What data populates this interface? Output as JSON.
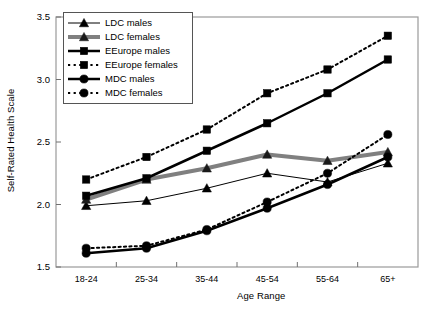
{
  "chart_data": {
    "type": "line",
    "title": "",
    "xlabel": "Age Range",
    "ylabel": "Self-Rated Health Scale",
    "categories": [
      "18-24",
      "25-34",
      "35-44",
      "45-54",
      "55-64",
      "65+"
    ],
    "ylim": [
      1.5,
      3.5
    ],
    "yticks": [
      1.5,
      2.0,
      2.5,
      3.0,
      3.5
    ],
    "ytick_labels": [
      "1.5",
      "2.0",
      "2.5",
      "3.0",
      "3.5"
    ],
    "grid": false,
    "legend_position": "upper-left-inside",
    "series": [
      {
        "name": "LDC males",
        "values": [
          1.99,
          2.03,
          2.13,
          2.25,
          2.18,
          2.33
        ],
        "color": "#000000",
        "line_style": "solid",
        "line_width": 1,
        "marker": "triangle"
      },
      {
        "name": "LDC females",
        "values": [
          2.04,
          2.2,
          2.29,
          2.4,
          2.35,
          2.42
        ],
        "color": "#808080",
        "line_style": "solid",
        "line_width": 4,
        "marker": "triangle"
      },
      {
        "name": "EEurope males",
        "values": [
          2.07,
          2.21,
          2.43,
          2.65,
          2.89,
          3.16
        ],
        "color": "#000000",
        "line_style": "solid",
        "line_width": 2.5,
        "marker": "square"
      },
      {
        "name": "EEurope females",
        "values": [
          2.2,
          2.38,
          2.6,
          2.89,
          3.08,
          3.35
        ],
        "color": "#000000",
        "line_style": "dotted",
        "line_width": 2,
        "marker": "square"
      },
      {
        "name": "MDC males",
        "values": [
          1.61,
          1.65,
          1.79,
          1.97,
          2.16,
          2.38
        ],
        "color": "#000000",
        "line_style": "solid",
        "line_width": 2.5,
        "marker": "circle"
      },
      {
        "name": "MDC females",
        "values": [
          1.65,
          1.67,
          1.8,
          2.02,
          2.25,
          2.56
        ],
        "color": "#000000",
        "line_style": "dotted",
        "line_width": 2,
        "marker": "circle"
      }
    ]
  },
  "axes": {
    "ylabel": "Self-Rated Health Scale",
    "xlabel": "Age Range"
  },
  "legend": {
    "items": [
      {
        "label": "LDC males"
      },
      {
        "label": "LDC females"
      },
      {
        "label": "EEurope males"
      },
      {
        "label": "EEurope females"
      },
      {
        "label": "MDC males"
      },
      {
        "label": "MDC females"
      }
    ]
  }
}
